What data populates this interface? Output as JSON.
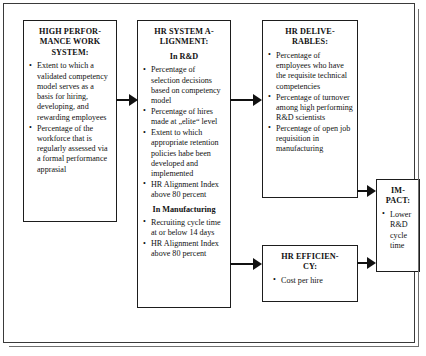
{
  "diagram": {
    "nodes": [
      {
        "id": "hpws",
        "title": "HIGH PERFOR-\nMANCE WORK\nSYSTEM:",
        "bullets": [
          "Extent to which a validated competency model serves as a basis for hiring, developing, and rewarding employees",
          "Percentage of the workforce that is regularly assessed via a formal performance apprasial"
        ]
      },
      {
        "id": "alignment",
        "title": "HR SYSTEM A-\nLIGNMENT:",
        "subtitle_1": "In R&D",
        "bullets_1": [
          "Percentage of selection decisions based on competency model",
          "Percentage of hires made at „elite“ level",
          "Extent to which appropriate retention policies habe been developed and implemented",
          "HR Alignment Index above 80 percent"
        ],
        "subtitle_2": "In Manufacturing",
        "bullets_2": [
          "Recruiting cycle time at or below 14 days",
          "HR Alignment Index above 80 percent"
        ]
      },
      {
        "id": "deliverables",
        "title": "HR DELIVE-\nRABLES:",
        "bullets": [
          "Percentage of employees who have the requisite technical competencies",
          "Percentage of turnover among high performing R&D scientists",
          "Percentage of open job requisition in manufacturing"
        ]
      },
      {
        "id": "efficiency",
        "title": "HR EFFICIEN-\nCY:",
        "bullets": [
          "Cost per hire"
        ]
      },
      {
        "id": "impact",
        "title": "IM-\nPACT:",
        "bullets": [
          "Lower R&D cycle time"
        ]
      }
    ],
    "arrows": [
      {
        "id": "hpws-to-alignment",
        "from": "hpws",
        "to": "alignment"
      },
      {
        "id": "alignment-to-deliverables",
        "from": "alignment",
        "to": "deliverables"
      },
      {
        "id": "alignment-to-efficiency",
        "from": "alignment",
        "to": "efficiency"
      },
      {
        "id": "deliverables-to-impact",
        "from": "deliverables",
        "to": "impact"
      },
      {
        "id": "efficiency-to-impact",
        "from": "efficiency",
        "to": "impact"
      }
    ],
    "colors": {
      "border": "#1d1d1d",
      "frame": "#3a3a3a",
      "frame_shadow": "#6f6f6f",
      "text": "#111111",
      "background": "#ffffff"
    }
  }
}
